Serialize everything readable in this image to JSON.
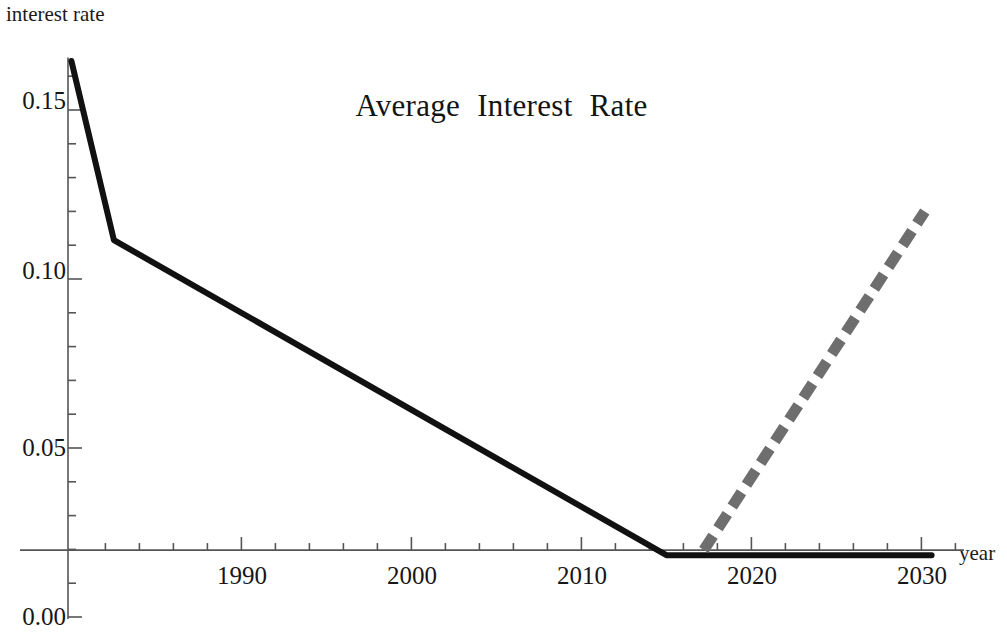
{
  "chart_data": {
    "type": "line",
    "title": "Average  Interest  Rate",
    "xlabel": "year",
    "ylabel": "interest rate",
    "xlim": [
      1979.8,
      2032.5
    ],
    "ylim": [
      0.0,
      0.1655
    ],
    "grid": false,
    "legend": "none",
    "x_ticks_major": [
      1990,
      2000,
      2010,
      2020,
      2030
    ],
    "x_tick_labels": [
      "1990",
      "2000",
      "2010",
      "2020",
      "2030"
    ],
    "x_minor_tick_step": 2,
    "y_ticks_major": [
      0.0,
      0.05,
      0.1,
      0.15
    ],
    "y_tick_labels": [
      "0.00",
      "0.05",
      "0.10",
      "0.15"
    ],
    "y_minor_tick_step": 0.01,
    "axis_crossing_y_value": 0.0198,
    "series": [
      {
        "name": "historical",
        "style": "solid",
        "color": "#111111",
        "width_px": 6,
        "points": [
          {
            "x": 1980.0,
            "y": 0.1645
          },
          {
            "x": 1982.5,
            "y": 0.1115
          },
          {
            "x": 2015.0,
            "y": 0.0183
          },
          {
            "x": 2030.6,
            "y": 0.0183
          }
        ]
      },
      {
        "name": "projection",
        "style": "dashed",
        "color": "#6e6e6e",
        "width_px": 11,
        "dash_pattern": "17 9",
        "points": [
          {
            "x": 2017.2,
            "y": 0.0198
          },
          {
            "x": 2030.2,
            "y": 0.12
          }
        ]
      }
    ]
  },
  "axes": {
    "y_axis_label": "interest rate",
    "x_axis_label": "year",
    "y_tick_labels": [
      "0.15",
      "0.10",
      "0.05",
      "0.00"
    ],
    "x_tick_labels": [
      "1990",
      "2000",
      "2010",
      "2020",
      "2030"
    ]
  },
  "title": {
    "text": "Average  Interest  Rate"
  },
  "colors": {
    "axis": "#555555",
    "solid_line": "#111111",
    "dashed_line": "#6e6e6e",
    "text": "#141414",
    "background": "#ffffff"
  }
}
